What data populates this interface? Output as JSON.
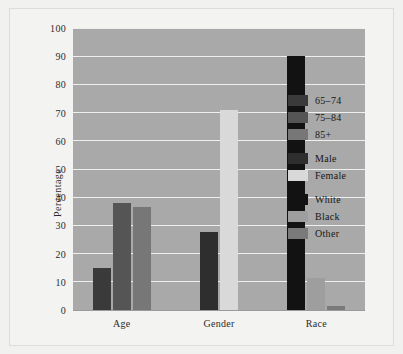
{
  "chart_data": {
    "type": "bar",
    "title": "",
    "subtitle": "",
    "xlabel": "",
    "ylabel": "Percentage",
    "ylim": [
      0,
      100
    ],
    "yticks": [
      0,
      10,
      20,
      30,
      40,
      50,
      60,
      70,
      80,
      90,
      100
    ],
    "grid": true,
    "legend_position": "inside-right",
    "categories": [
      "Age",
      "Gender",
      "Race"
    ],
    "groups": [
      {
        "category": "Age",
        "bars": [
          {
            "name": "65-74",
            "label": "65–74",
            "value": 15.0,
            "color": "#3a3a3a"
          },
          {
            "name": "75-84",
            "label": "75–84",
            "value": 38.0,
            "color": "#555555"
          },
          {
            "name": "85+",
            "label": "85+",
            "value": 36.5,
            "color": "#777777"
          }
        ]
      },
      {
        "category": "Gender",
        "bars": [
          {
            "name": "Male",
            "label": "Male",
            "value": 27.5,
            "color": "#2e2e2e"
          },
          {
            "name": "Female",
            "label": "Female",
            "value": 71.0,
            "color": "#d9d9d9"
          }
        ]
      },
      {
        "category": "Race",
        "bars": [
          {
            "name": "White",
            "label": "White",
            "value": 90.0,
            "color": "#121212"
          },
          {
            "name": "Black",
            "label": "Black",
            "value": 11.5,
            "color": "#9e9e9e"
          },
          {
            "name": "Other",
            "label": "Other",
            "value": 1.5,
            "color": "#7a7a7a"
          }
        ]
      }
    ],
    "legend": [
      {
        "label": "65–74",
        "color": "#3a3a3a"
      },
      {
        "label": "75–84",
        "color": "#555555"
      },
      {
        "label": "85+",
        "color": "#777777"
      },
      {
        "label": "Male",
        "color": "#2e2e2e"
      },
      {
        "label": "Female",
        "color": "#d9d9d9"
      },
      {
        "label": "White",
        "color": "#121212"
      },
      {
        "label": "Black",
        "color": "#9e9e9e"
      },
      {
        "label": "Other",
        "color": "#7a7a7a"
      }
    ],
    "legend_groups": [
      [
        "65–74",
        "75–84",
        "85+"
      ],
      [
        "Male",
        "Female"
      ],
      [
        "White",
        "Black",
        "Other"
      ]
    ],
    "colors": {
      "plot_background": "#a9a9a9",
      "figure_background": "#f1f1ef",
      "gridline": "#efefef",
      "text": "#2b2b2b"
    }
  }
}
